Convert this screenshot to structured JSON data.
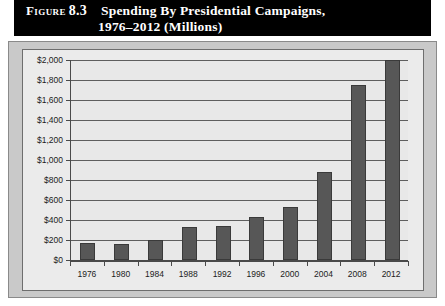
{
  "figure": {
    "label_word": "Figure",
    "number": "8.3",
    "title_line1": "Spending By Presidential Campaigns,",
    "title_line2": "1976–2012 (Millions)"
  },
  "colors": {
    "header_background": "#000000",
    "header_text": "#ffffff",
    "panel_background": "#c9c9c9",
    "plot_background": "#e8e8e8",
    "bar_fill": "#575757",
    "gridline": "#5e5e5e",
    "axis": "#4a4a4a"
  },
  "chart_data": {
    "type": "bar",
    "title": "Spending By Presidential Campaigns, 1976–2012 (Millions)",
    "xlabel": "",
    "ylabel": "",
    "categories": [
      "1976",
      "1980",
      "1984",
      "1988",
      "1992",
      "1996",
      "2000",
      "2004",
      "2008",
      "2012"
    ],
    "values": [
      170,
      162,
      202,
      330,
      340,
      426,
      530,
      880,
      1750,
      2000
    ],
    "ylim": [
      0,
      2000
    ],
    "ytick_values": [
      0,
      200,
      400,
      600,
      800,
      1000,
      1200,
      1400,
      1600,
      1800,
      2000
    ],
    "ytick_labels": [
      "$0",
      "$200",
      "$400",
      "$600",
      "$800",
      "$1,000",
      "$1,200",
      "$1,400",
      "$1,600",
      "$1,800",
      "$2,000"
    ],
    "grid": true,
    "legend": false,
    "series": [
      {
        "name": "Spending (Millions)",
        "values": [
          170,
          162,
          202,
          330,
          340,
          426,
          530,
          880,
          1750,
          2000
        ]
      }
    ]
  }
}
